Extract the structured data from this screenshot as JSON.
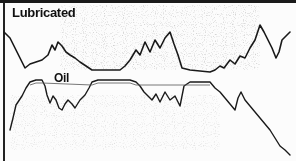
{
  "chart_data": {
    "type": "line",
    "title": "",
    "xlabel": "",
    "ylabel": "",
    "grid": false,
    "legend_position": "inline",
    "annotations": [
      "Lubricated",
      "Oil"
    ],
    "series": [
      {
        "name": "Lubricated",
        "color": "#1a1a1a",
        "points": [
          [
            4,
            32
          ],
          [
            10,
            38
          ],
          [
            15,
            48
          ],
          [
            20,
            58
          ],
          [
            25,
            68
          ],
          [
            30,
            64
          ],
          [
            36,
            62
          ],
          [
            42,
            60
          ],
          [
            48,
            55
          ],
          [
            52,
            45
          ],
          [
            55,
            50
          ],
          [
            58,
            42
          ],
          [
            62,
            46
          ],
          [
            66,
            52
          ],
          [
            70,
            55
          ],
          [
            75,
            58
          ],
          [
            80,
            62
          ],
          [
            86,
            66
          ],
          [
            92,
            70
          ],
          [
            100,
            70
          ],
          [
            110,
            70
          ],
          [
            120,
            70
          ],
          [
            125,
            66
          ],
          [
            130,
            60
          ],
          [
            136,
            50
          ],
          [
            140,
            55
          ],
          [
            145,
            42
          ],
          [
            150,
            52
          ],
          [
            155,
            40
          ],
          [
            160,
            48
          ],
          [
            165,
            38
          ],
          [
            170,
            32
          ],
          [
            174,
            44
          ],
          [
            178,
            55
          ],
          [
            182,
            68
          ],
          [
            190,
            70
          ],
          [
            200,
            71
          ],
          [
            210,
            72
          ],
          [
            215,
            70
          ],
          [
            220,
            66
          ],
          [
            224,
            68
          ],
          [
            230,
            60
          ],
          [
            235,
            64
          ],
          [
            240,
            56
          ],
          [
            245,
            58
          ],
          [
            250,
            48
          ],
          [
            255,
            40
          ],
          [
            260,
            25
          ],
          [
            264,
            32
          ],
          [
            268,
            40
          ],
          [
            272,
            48
          ],
          [
            276,
            58
          ],
          [
            279,
            52
          ],
          [
            282,
            40
          ],
          [
            286,
            36
          ],
          [
            290,
            32
          ]
        ]
      },
      {
        "name": "Oil",
        "color": "#1a1a1a",
        "points": [
          [
            10,
            130
          ],
          [
            13,
            118
          ],
          [
            16,
            105
          ],
          [
            22,
            96
          ],
          [
            26,
            88
          ],
          [
            30,
            82
          ],
          [
            36,
            80
          ],
          [
            42,
            80
          ],
          [
            45,
            86
          ],
          [
            47,
            95
          ],
          [
            50,
            103
          ],
          [
            53,
            96
          ],
          [
            56,
            100
          ],
          [
            59,
            108
          ],
          [
            62,
            110
          ],
          [
            65,
            104
          ],
          [
            68,
            100
          ],
          [
            72,
            104
          ],
          [
            75,
            108
          ],
          [
            80,
            100
          ],
          [
            85,
            95
          ],
          [
            89,
            88
          ],
          [
            92,
            82
          ],
          [
            98,
            80
          ],
          [
            110,
            80
          ],
          [
            120,
            80
          ],
          [
            130,
            80
          ],
          [
            136,
            82
          ],
          [
            140,
            86
          ],
          [
            144,
            92
          ],
          [
            148,
            96
          ],
          [
            152,
            100
          ],
          [
            156,
            94
          ],
          [
            160,
            102
          ],
          [
            165,
            92
          ],
          [
            170,
            100
          ],
          [
            175,
            96
          ],
          [
            180,
            106
          ],
          [
            184,
            86
          ],
          [
            190,
            82
          ],
          [
            200,
            82
          ],
          [
            210,
            82
          ],
          [
            215,
            88
          ],
          [
            220,
            92
          ],
          [
            225,
            98
          ],
          [
            230,
            104
          ],
          [
            235,
            110
          ],
          [
            238,
            98
          ],
          [
            241,
            92
          ],
          [
            245,
            100
          ],
          [
            250,
            106
          ],
          [
            255,
            112
          ],
          [
            260,
            118
          ],
          [
            265,
            124
          ],
          [
            270,
            130
          ],
          [
            275,
            138
          ],
          [
            280,
            146
          ],
          [
            285,
            150
          ],
          [
            290,
            155
          ]
        ]
      }
    ],
    "xlim": [
      0,
      296
    ],
    "ylim": [
      161,
      0
    ]
  },
  "labels": {
    "upper": "Lubricated",
    "lower": "Oil"
  }
}
